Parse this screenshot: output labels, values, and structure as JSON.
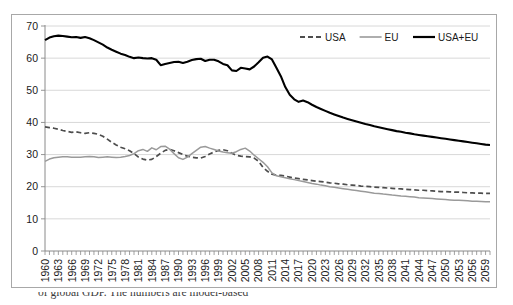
{
  "chart_data": {
    "type": "line",
    "title": "",
    "subtitle": "",
    "xlabel": "",
    "ylabel": "",
    "xlim": [
      1960,
      2060
    ],
    "ylim": [
      0,
      70
    ],
    "ytick_step": 10,
    "xtick_label_step": 3,
    "grid": "horizontal",
    "legend_position": "top-right-inside",
    "yticks": [
      0,
      10,
      20,
      30,
      40,
      50,
      60,
      70
    ],
    "xticks": [
      "1960",
      "1963",
      "1966",
      "1969",
      "1972",
      "1975",
      "1978",
      "1981",
      "1984",
      "1987",
      "1990",
      "1993",
      "1996",
      "1999",
      "2002",
      "2005",
      "2008",
      "2011",
      "2014",
      "2017",
      "2020",
      "2023",
      "2026",
      "2029",
      "2032",
      "2035",
      "2038",
      "2041",
      "2044",
      "2047",
      "2050",
      "2053",
      "2056",
      "2059"
    ],
    "x": [
      1960,
      1961,
      1962,
      1963,
      1964,
      1965,
      1966,
      1967,
      1968,
      1969,
      1970,
      1971,
      1972,
      1973,
      1974,
      1975,
      1976,
      1977,
      1978,
      1979,
      1980,
      1981,
      1982,
      1983,
      1984,
      1985,
      1986,
      1987,
      1988,
      1989,
      1990,
      1991,
      1992,
      1993,
      1994,
      1995,
      1996,
      1997,
      1998,
      1999,
      2000,
      2001,
      2002,
      2003,
      2004,
      2005,
      2006,
      2007,
      2008,
      2009,
      2010,
      2011,
      2012,
      2013,
      2014,
      2015,
      2016,
      2017,
      2018,
      2019,
      2020,
      2021,
      2022,
      2023,
      2024,
      2025,
      2026,
      2027,
      2028,
      2029,
      2030,
      2031,
      2032,
      2033,
      2034,
      2035,
      2036,
      2037,
      2038,
      2039,
      2040,
      2041,
      2042,
      2043,
      2044,
      2045,
      2046,
      2047,
      2048,
      2049,
      2050,
      2051,
      2052,
      2053,
      2054,
      2055,
      2056,
      2057,
      2058,
      2059,
      2060
    ],
    "series": [
      {
        "name": "USA",
        "style": "dashed",
        "color": "#4d4d4d",
        "values": [
          38.6,
          38.4,
          38.2,
          37.9,
          37.5,
          37.2,
          36.9,
          37.1,
          36.8,
          36.6,
          36.8,
          36.6,
          36.3,
          35.7,
          34.8,
          33.8,
          33.0,
          32.3,
          31.8,
          31.2,
          30.3,
          29.2,
          28.6,
          28.3,
          28.5,
          29.4,
          30.4,
          31.3,
          31.6,
          31.2,
          30.6,
          30.0,
          29.5,
          29.2,
          29.0,
          28.9,
          29.4,
          30.2,
          30.8,
          31.3,
          31.5,
          31.2,
          30.4,
          29.8,
          29.5,
          29.4,
          29.3,
          28.9,
          27.9,
          26.0,
          24.8,
          23.9,
          23.6,
          23.5,
          23.3,
          23.0,
          22.7,
          22.5,
          22.3,
          22.1,
          21.9,
          21.7,
          21.6,
          21.4,
          21.2,
          21.1,
          20.9,
          20.8,
          20.6,
          20.5,
          20.4,
          20.2,
          20.1,
          20.0,
          19.9,
          19.8,
          19.7,
          19.6,
          19.5,
          19.4,
          19.3,
          19.2,
          19.1,
          19.0,
          18.9,
          18.9,
          18.8,
          18.7,
          18.6,
          18.5,
          18.5,
          18.4,
          18.3,
          18.3,
          18.2,
          18.1,
          18.1,
          18.0,
          18.0,
          17.9,
          17.9
        ]
      },
      {
        "name": "EU",
        "style": "solid",
        "color": "#9a9a9a",
        "values": [
          27.9,
          28.6,
          29.0,
          29.2,
          29.3,
          29.3,
          29.2,
          29.2,
          29.2,
          29.3,
          29.4,
          29.3,
          29.1,
          29.2,
          29.3,
          29.2,
          29.1,
          29.2,
          29.4,
          29.7,
          30.3,
          31.2,
          31.6,
          31.0,
          32.1,
          31.5,
          32.5,
          32.6,
          31.7,
          30.3,
          29.0,
          28.5,
          29.2,
          30.3,
          31.3,
          32.3,
          32.5,
          32.0,
          31.6,
          31.1,
          30.8,
          30.6,
          30.4,
          30.9,
          31.6,
          32.0,
          31.1,
          29.8,
          28.7,
          27.6,
          26.2,
          24.3,
          23.4,
          23.1,
          22.8,
          22.5,
          22.2,
          21.9,
          21.6,
          21.3,
          21.0,
          20.8,
          20.5,
          20.3,
          20.0,
          19.8,
          19.6,
          19.4,
          19.2,
          19.0,
          18.8,
          18.6,
          18.4,
          18.2,
          18.0,
          17.9,
          17.7,
          17.6,
          17.4,
          17.3,
          17.1,
          17.0,
          16.9,
          16.8,
          16.6,
          16.5,
          16.4,
          16.3,
          16.2,
          16.1,
          16.0,
          15.9,
          15.8,
          15.8,
          15.7,
          15.6,
          15.5,
          15.5,
          15.4,
          15.3,
          15.3
        ]
      },
      {
        "name": "USA+EU",
        "style": "solid-bold",
        "color": "#000000",
        "values": [
          65.6,
          66.4,
          66.8,
          67.0,
          66.9,
          66.7,
          66.5,
          66.6,
          66.3,
          66.6,
          66.2,
          65.6,
          64.9,
          64.2,
          63.3,
          62.6,
          62.0,
          61.4,
          61.0,
          60.4,
          60.0,
          60.2,
          60.0,
          59.9,
          60.0,
          59.5,
          57.8,
          58.2,
          58.5,
          58.8,
          58.9,
          58.5,
          58.9,
          59.4,
          59.7,
          59.8,
          59.1,
          59.5,
          59.5,
          59.0,
          58.2,
          57.8,
          56.2,
          56.0,
          57.0,
          56.8,
          56.5,
          57.4,
          58.7,
          60.1,
          60.5,
          59.6,
          57.0,
          54.4,
          51.0,
          48.6,
          47.2,
          46.4,
          46.8,
          46.3,
          45.5,
          44.8,
          44.2,
          43.6,
          43.0,
          42.5,
          42.0,
          41.5,
          41.1,
          40.7,
          40.3,
          39.9,
          39.5,
          39.2,
          38.8,
          38.5,
          38.2,
          37.9,
          37.6,
          37.3,
          37.1,
          36.8,
          36.6,
          36.3,
          36.1,
          35.9,
          35.7,
          35.5,
          35.3,
          35.1,
          34.9,
          34.7,
          34.5,
          34.3,
          34.1,
          33.9,
          33.7,
          33.5,
          33.3,
          33.1,
          33.0
        ]
      }
    ],
    "legend": [
      {
        "label": "USA",
        "style": "dashed",
        "color": "#4d4d4d"
      },
      {
        "label": "EU",
        "style": "solid",
        "color": "#9a9a9a"
      },
      {
        "label": "USA+EU",
        "style": "solid-bold",
        "color": "#000000"
      }
    ]
  },
  "caption": {
    "text": "of global GDP. The numbers are model-based"
  }
}
